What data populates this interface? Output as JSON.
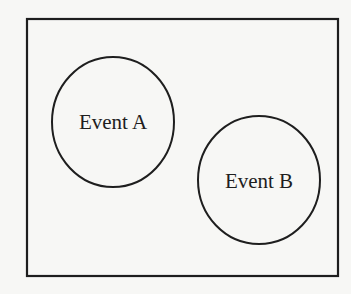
{
  "diagram": {
    "type": "venn",
    "sample_space": {
      "x": 27,
      "y": 19,
      "width": 311,
      "height": 257,
      "stroke": "#1e1e1e"
    },
    "events": [
      {
        "label": "Event A",
        "cx": 113,
        "cy": 122,
        "rx": 61,
        "ry": 65
      },
      {
        "label": "Event B",
        "cx": 259,
        "cy": 180,
        "rx": 61,
        "ry": 64
      }
    ],
    "background": "#f7f7f5"
  }
}
